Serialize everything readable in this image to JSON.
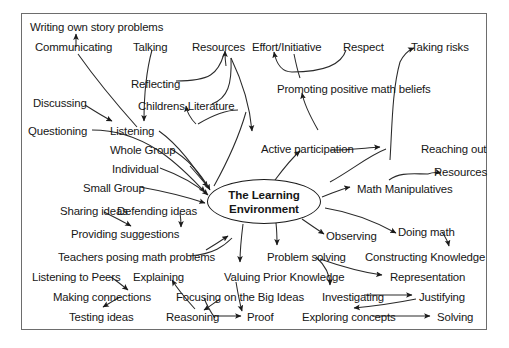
{
  "header": {
    "cutoff_text": "Math Climate"
  },
  "diagram": {
    "center": {
      "label_line1": "The Learning",
      "label_line2": "Environment"
    },
    "nodes": [
      {
        "id": "writing-own-story-problems",
        "label": "Writing own story problems",
        "x": 30,
        "y": 22
      },
      {
        "id": "communicating",
        "label": "Communicating",
        "x": 35,
        "y": 42
      },
      {
        "id": "talking",
        "label": "Talking",
        "x": 133,
        "y": 42
      },
      {
        "id": "resources-top",
        "label": "Resources",
        "x": 192,
        "y": 42
      },
      {
        "id": "effort-initiative",
        "label": "Effort/Initiative",
        "x": 252,
        "y": 42
      },
      {
        "id": "respect",
        "label": "Respect",
        "x": 343,
        "y": 42
      },
      {
        "id": "taking-risks",
        "label": "Taking risks",
        "x": 411,
        "y": 42
      },
      {
        "id": "reflecting",
        "label": "Reflecting",
        "x": 131,
        "y": 79
      },
      {
        "id": "promoting-positive-math-beliefs",
        "label": "Promoting positive math beliefs",
        "x": 277,
        "y": 84
      },
      {
        "id": "discussing",
        "label": "Discussing",
        "x": 33,
        "y": 98
      },
      {
        "id": "childrens-literature",
        "label": "Childrens Literature",
        "x": 138,
        "y": 101
      },
      {
        "id": "questioning",
        "label": "Questioning",
        "x": 28,
        "y": 126
      },
      {
        "id": "listening",
        "label": "Listening",
        "x": 110,
        "y": 126
      },
      {
        "id": "active-participation",
        "label": "Active participation",
        "x": 261,
        "y": 144
      },
      {
        "id": "reaching-out",
        "label": "Reaching out",
        "x": 421,
        "y": 144
      },
      {
        "id": "whole-group",
        "label": "Whole Group",
        "x": 110,
        "y": 145
      },
      {
        "id": "individual",
        "label": "Individual",
        "x": 112,
        "y": 164
      },
      {
        "id": "resources-right",
        "label": "Resources",
        "x": 434,
        "y": 167
      },
      {
        "id": "small-group",
        "label": "Small Group",
        "x": 83,
        "y": 183
      },
      {
        "id": "math-manipulatives",
        "label": "Math Manipulatives",
        "x": 357,
        "y": 184
      },
      {
        "id": "sharing-ideas",
        "label": "Sharing ideas",
        "x": 60,
        "y": 206
      },
      {
        "id": "defending-ideas",
        "label": "Defending ideas",
        "x": 117,
        "y": 206
      },
      {
        "id": "doing-math",
        "label": "Doing math",
        "x": 398,
        "y": 227
      },
      {
        "id": "providing-suggestions",
        "label": "Providing suggestions",
        "x": 71,
        "y": 229
      },
      {
        "id": "observing",
        "label": "Observing",
        "x": 326,
        "y": 231
      },
      {
        "id": "teachers-posing-math-problems",
        "label": "Teachers posing math problems",
        "x": 58,
        "y": 252
      },
      {
        "id": "problem-solving",
        "label": "Problem solving",
        "x": 267,
        "y": 252
      },
      {
        "id": "constructing-knowledge",
        "label": "Constructing Knowledge",
        "x": 365,
        "y": 252
      },
      {
        "id": "listening-to-peers",
        "label": "Listening to Peers",
        "x": 32,
        "y": 272
      },
      {
        "id": "explaining",
        "label": "Explaining",
        "x": 133,
        "y": 272
      },
      {
        "id": "valuing-prior-knowledge",
        "label": "Valuing Prior Knowledge",
        "x": 224,
        "y": 272
      },
      {
        "id": "representation",
        "label": "Representation",
        "x": 390,
        "y": 272
      },
      {
        "id": "making-connections",
        "label": "Making connections",
        "x": 53,
        "y": 292
      },
      {
        "id": "focusing-on-the-big-ideas",
        "label": "Focusing on the Big Ideas",
        "x": 176,
        "y": 292
      },
      {
        "id": "investigating",
        "label": "Investigating",
        "x": 322,
        "y": 292
      },
      {
        "id": "justifying",
        "label": "Justifying",
        "x": 419,
        "y": 292
      },
      {
        "id": "testing-ideas",
        "label": "Testing ideas",
        "x": 69,
        "y": 312
      },
      {
        "id": "reasoning",
        "label": "Reasoning",
        "x": 166,
        "y": 312
      },
      {
        "id": "proof",
        "label": "Proof",
        "x": 247,
        "y": 312
      },
      {
        "id": "exploring-concepts",
        "label": "Exploring concepts",
        "x": 302,
        "y": 312
      },
      {
        "id": "solving",
        "label": "Solving",
        "x": 437,
        "y": 312
      }
    ],
    "edges": [
      {
        "from": "communicating",
        "to": "writing-own-story-problems"
      },
      {
        "from": "communicating-curve",
        "to": "listening"
      },
      {
        "from": "talking",
        "to": "listening"
      },
      {
        "from": "discussing",
        "to": "listening-area"
      },
      {
        "from": "reflecting",
        "to": "resources-top"
      },
      {
        "from": "childrens-literature",
        "to": "resources-top"
      },
      {
        "from": "childrens-literature-curve",
        "to": "active-participation"
      },
      {
        "from": "respect",
        "to": "effort-initiative"
      },
      {
        "from": "promoting-positive-math-beliefs",
        "to": "effort-initiative-curve"
      },
      {
        "from": "active-participation-curve",
        "to": "promoting-positive-math-beliefs"
      },
      {
        "from": "taking-risks-curve",
        "to": "taking-risks"
      },
      {
        "from": "questioning",
        "to": "center"
      },
      {
        "from": "listening",
        "to": "center"
      },
      {
        "from": "whole-group",
        "to": "center"
      },
      {
        "from": "individual",
        "to": "center"
      },
      {
        "from": "small-group",
        "to": "center"
      },
      {
        "from": "center",
        "to": "active-participation"
      },
      {
        "from": "center",
        "to": "math-manipulatives"
      },
      {
        "from": "center",
        "to": "observing"
      },
      {
        "from": "center",
        "to": "problem-solving"
      },
      {
        "from": "center",
        "to": "valuing-prior-knowledge"
      },
      {
        "from": "active-participation",
        "to": "reaching-out"
      },
      {
        "from": "math-manipulatives",
        "to": "resources-right"
      },
      {
        "from": "center-curve",
        "to": "doing-math"
      },
      {
        "from": "doing-math",
        "to": "constructing-knowledge"
      },
      {
        "from": "sharing-ideas",
        "to": "providing-suggestions"
      },
      {
        "from": "defending-ideas",
        "to": "providing-suggestions"
      },
      {
        "from": "teachers-posing-math-problems",
        "to": "center"
      },
      {
        "from": "listening-to-peers",
        "to": "making-connections"
      },
      {
        "from": "making-connections",
        "to": "testing-ideas"
      },
      {
        "from": "explaining",
        "to": "reasoning"
      },
      {
        "from": "reasoning",
        "to": "explaining"
      },
      {
        "from": "reasoning",
        "to": "proof"
      },
      {
        "from": "focusing-on-the-big-ideas",
        "to": "investigating"
      },
      {
        "from": "problem-solving",
        "to": "investigating"
      },
      {
        "from": "problem-solving",
        "to": "representation"
      },
      {
        "from": "investigating",
        "to": "justifying"
      },
      {
        "from": "justifying",
        "to": "exploring-concepts"
      },
      {
        "from": "exploring-concepts",
        "to": "solving"
      }
    ]
  },
  "colors": {
    "ink": "#161616",
    "frame": "#6d6d6d",
    "background": "#ffffff",
    "cutoff_text": "#9a9aa0"
  }
}
